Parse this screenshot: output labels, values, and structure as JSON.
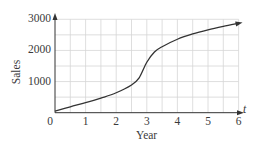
{
  "chart_data": {
    "type": "line",
    "title": "",
    "xlabel": "Year",
    "ylabel": "Sales",
    "x_axis_var": "t",
    "xlim": [
      0,
      6
    ],
    "ylim": [
      0,
      3000
    ],
    "x_ticks": [
      "0",
      "1",
      "2",
      "3",
      "4",
      "5",
      "6"
    ],
    "y_ticks": [
      "1000",
      "2000",
      "3000"
    ],
    "grid": {
      "on": true,
      "x_step": 0.5,
      "y_step": 500
    },
    "legend": null,
    "series": [
      {
        "name": "Sales",
        "x": [
          0,
          0.5,
          1,
          1.5,
          2,
          2.5,
          2.75,
          3,
          3.25,
          3.5,
          4,
          4.5,
          5,
          5.5,
          6
        ],
        "values": [
          50,
          190,
          320,
          470,
          640,
          890,
          1120,
          1620,
          1950,
          2120,
          2360,
          2530,
          2660,
          2770,
          2870
        ]
      }
    ],
    "colors": {
      "line": "#333333",
      "grid": "#d6d6d6",
      "axis": "#333333",
      "text": "#3a3a3a"
    }
  }
}
